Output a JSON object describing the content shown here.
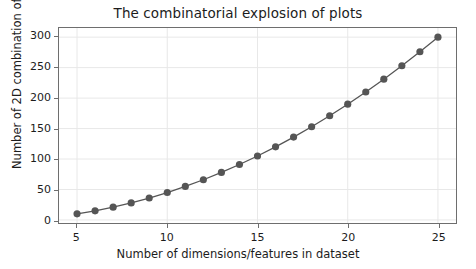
{
  "chart_data": {
    "type": "line",
    "title": "The combinatorial explosion of plots",
    "xlabel": "Number of dimensions/features in dataset",
    "ylabel": "Number of 2D combination of plots",
    "x": [
      5,
      6,
      7,
      8,
      9,
      10,
      11,
      12,
      13,
      14,
      15,
      16,
      17,
      18,
      19,
      20,
      21,
      22,
      23,
      24,
      25
    ],
    "values": [
      10,
      15,
      21,
      28,
      36,
      45,
      55,
      66,
      78,
      91,
      105,
      120,
      136,
      153,
      171,
      190,
      210,
      231,
      253,
      276,
      300
    ],
    "series": [
      {
        "name": "2D combinations",
        "values": [
          10,
          15,
          21,
          28,
          36,
          45,
          55,
          66,
          78,
          91,
          105,
          120,
          136,
          153,
          171,
          190,
          210,
          231,
          253,
          276,
          300
        ]
      }
    ],
    "xlim": [
      4.0,
      26.0
    ],
    "ylim": [
      -5.0,
      315.0
    ],
    "xticks": [
      5,
      10,
      15,
      20,
      25
    ],
    "xtick_labels": [
      "5",
      "10",
      "15",
      "20",
      "25"
    ],
    "yticks": [
      0,
      50,
      100,
      150,
      200,
      250,
      300
    ],
    "ytick_labels": [
      "0",
      "50",
      "100",
      "150",
      "200",
      "250",
      "300"
    ],
    "grid": true,
    "legend": null,
    "marker": "circle",
    "line_color": "#555555",
    "marker_color": "#555555",
    "grid_color": "#e8e8e8",
    "axes_color": "#6e6e6e",
    "background_color": "#ffffff"
  }
}
